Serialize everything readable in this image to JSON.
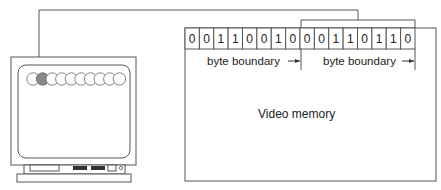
{
  "diagram": {
    "bits": [
      "0",
      "0",
      "1",
      "1",
      "0",
      "0",
      "1",
      "0",
      "0",
      "0",
      "1",
      "1",
      "0",
      "1",
      "1",
      "0"
    ],
    "byte_boundary_labels": [
      "byte boundary",
      "byte boundary"
    ],
    "memory_label": "Video memory",
    "monitor": {
      "pixel_count": 10,
      "highlighted_pixel_index": 1
    },
    "colors": {
      "line": "#555555",
      "highlight_pixel": "#888888",
      "button": "#333333"
    }
  }
}
